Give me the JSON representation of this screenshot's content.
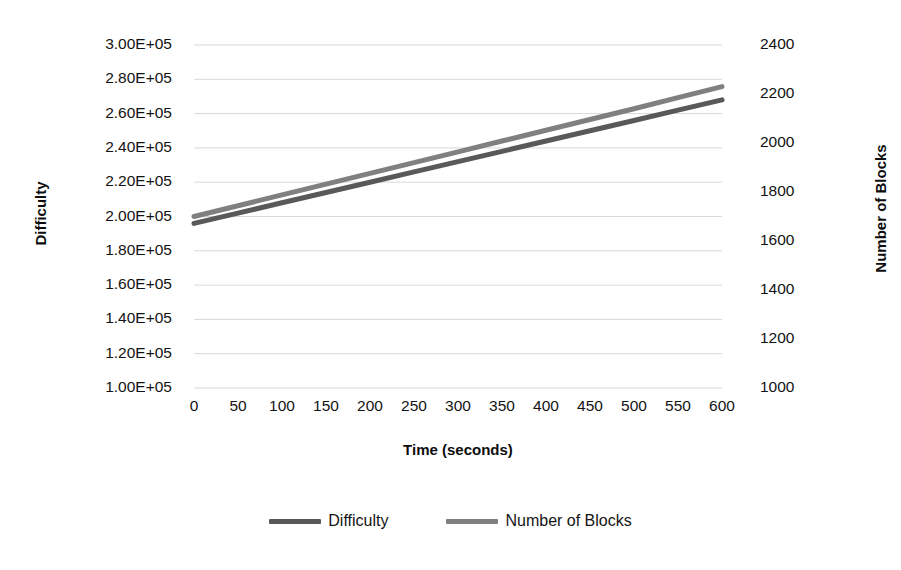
{
  "chart_data": {
    "type": "line",
    "title": "",
    "xlabel": "Time (seconds)",
    "ylabel": "Difficulty",
    "y2label": "Number of Blocks",
    "grid": true,
    "legend_position": "bottom",
    "xlim": [
      0,
      600
    ],
    "ylim": [
      100000,
      300000
    ],
    "y2lim": [
      1000,
      2400
    ],
    "x": [
      0,
      50,
      100,
      150,
      200,
      250,
      300,
      350,
      400,
      450,
      500,
      550,
      600
    ],
    "xticklabels": [
      "0",
      "50",
      "100",
      "150",
      "200",
      "250",
      "300",
      "350",
      "400",
      "450",
      "500",
      "550",
      "600"
    ],
    "yticks": [
      300000,
      280000,
      260000,
      240000,
      220000,
      200000,
      180000,
      160000,
      140000,
      120000,
      100000
    ],
    "yticklabels": [
      "3.00E+05",
      "2.80E+05",
      "2.60E+05",
      "2.40E+05",
      "2.20E+05",
      "2.00E+05",
      "1.80E+05",
      "1.60E+05",
      "1.40E+05",
      "1.20E+05",
      "1.00E+05"
    ],
    "y2ticks": [
      2400,
      2200,
      2000,
      1800,
      1600,
      1400,
      1200,
      1000
    ],
    "y2ticklabels": [
      "2400",
      "2200",
      "2000",
      "1800",
      "1600",
      "1400",
      "1200",
      "1000"
    ],
    "series": [
      {
        "name": "Difficulty",
        "axis": "left",
        "color": "#595959",
        "values": [
          196000,
          202000,
          208000,
          214000,
          220000,
          226000,
          232000,
          238000,
          244000,
          250000,
          256000,
          262000,
          268000
        ]
      },
      {
        "name": "Number of Blocks",
        "axis": "right",
        "color": "#808080",
        "values": [
          1700,
          1744,
          1788,
          1832,
          1876,
          1920,
          1964,
          2008,
          2052,
          2096,
          2140,
          2185,
          2230
        ]
      }
    ]
  },
  "legend": {
    "items": [
      {
        "label": "Difficulty",
        "color": "#595959"
      },
      {
        "label": "Number of Blocks",
        "color": "#808080"
      }
    ]
  },
  "colors": {
    "difficulty": "#595959",
    "blocks": "#808080",
    "gridline": "#d9d9d9",
    "text": "#131313",
    "background": "#ffffff"
  }
}
